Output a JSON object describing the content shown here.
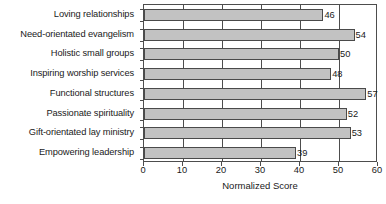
{
  "chart_data": {
    "type": "bar",
    "orientation": "horizontal",
    "title": "",
    "xlabel": "Normalized Score",
    "ylabel": "",
    "xlim": [
      0,
      60
    ],
    "xticks": [
      0,
      10,
      20,
      30,
      40,
      50,
      60
    ],
    "grid": "vertical",
    "legend": "none",
    "categories": [
      "Loving relationships",
      "Need-orientated evangelism",
      "Holistic small groups",
      "Inspiring worship services",
      "Functional structures",
      "Passionate spirituality",
      "Gift-orientated lay ministry",
      "Empowering leadership"
    ],
    "values": [
      46,
      54,
      50,
      48,
      57,
      52,
      53,
      39
    ],
    "data_labels": [
      "46",
      "54",
      "50",
      "48",
      "57",
      "52",
      "53",
      "39"
    ],
    "colors": {
      "bar_fill": "#c2c2c2",
      "bar_border": "#4a4a4a",
      "axis": "#4d4d4d",
      "text": "#1a1a1a",
      "background": "#ffffff"
    }
  }
}
